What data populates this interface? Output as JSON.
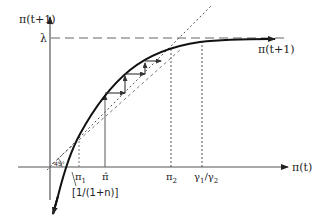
{
  "figure": {
    "type": "phase diagram",
    "axes": {
      "x_label": "π(t)",
      "y_label": "π(t+1)"
    },
    "levels": {
      "lambda_label": "λ"
    },
    "curve_label": "π(t+1)",
    "angle_label": "45°",
    "x_ticks": {
      "pi1": "π",
      "pi1_sub": "1",
      "pihat": "π̂",
      "pi2": "π",
      "pi2_sub": "2",
      "gamma_ratio_a": "γ",
      "gamma_ratio_a_sub": "1",
      "gamma_ratio_slash": "/",
      "gamma_ratio_b": "γ",
      "gamma_ratio_b_sub": "2"
    },
    "slope_label": "[1/(1+n)]",
    "colors": {
      "ink": "#222222",
      "gray": "#555555"
    }
  }
}
